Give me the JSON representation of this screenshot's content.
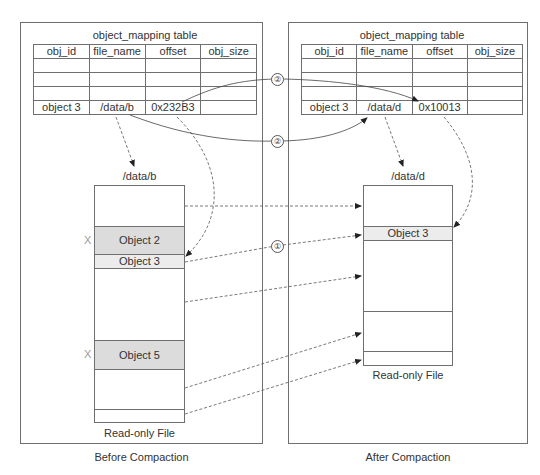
{
  "before": {
    "caption": "Before Compaction",
    "table": {
      "title": "object_mapping table",
      "columns": [
        "obj_id",
        "file_name",
        "offset",
        "obj_size"
      ],
      "rows": [
        [
          "",
          "",
          "",
          ""
        ],
        [
          "",
          "",
          "",
          ""
        ],
        [
          "",
          "",
          "",
          ""
        ],
        [
          "object 3",
          "/data/b",
          "0x232B3",
          ""
        ]
      ]
    },
    "file": {
      "name": "/data/b",
      "caption": "Read-only File",
      "objects": [
        {
          "label": "Object 2",
          "removed_mark": "X"
        },
        {
          "label": "Object 3",
          "removed_mark": ""
        },
        {
          "label": "Object 5",
          "removed_mark": "X"
        }
      ]
    }
  },
  "after": {
    "caption": "After Compaction",
    "table": {
      "title": "object_mapping table",
      "columns": [
        "obj_id",
        "file_name",
        "offset",
        "obj_size"
      ],
      "rows": [
        [
          "",
          "",
          "",
          ""
        ],
        [
          "",
          "",
          "",
          ""
        ],
        [
          "",
          "",
          "",
          ""
        ],
        [
          "object 3",
          "/data/d",
          "0x10013",
          ""
        ]
      ]
    },
    "file": {
      "name": "/data/d",
      "caption": "Read-only File",
      "objects": [
        {
          "label": "Object 3"
        }
      ]
    }
  },
  "steps": {
    "step1": "①",
    "step2": "②"
  },
  "colors": {
    "border": "#6f6f6f",
    "object_removed_fill": "#dcdcdc",
    "object_kept_fill": "#ececec",
    "x_mark": "#9a9a9a"
  }
}
